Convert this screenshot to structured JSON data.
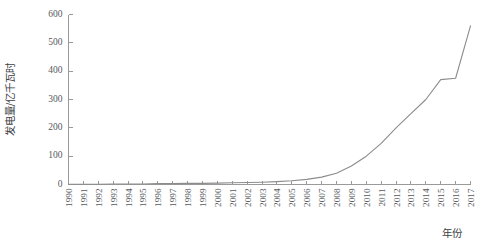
{
  "chart_data": {
    "type": "line",
    "title": "",
    "subtitle": "",
    "xlabel": "年份",
    "ylabel": "发电量/亿千瓦时",
    "xlim": [
      1990,
      2017
    ],
    "ylim": [
      0,
      600
    ],
    "ytick_step": 100,
    "grid": false,
    "legend": false,
    "legend_position": "none",
    "line_color": "#8c8c8c",
    "axis_color": "#9a9a9a",
    "background_color": "#ffffff",
    "categories": [
      "1990",
      "1991",
      "1992",
      "1993",
      "1994",
      "1995",
      "1996",
      "1997",
      "1998",
      "1999",
      "2000",
      "2001",
      "2002",
      "2003",
      "2004",
      "2005",
      "2006",
      "2007",
      "2008",
      "2009",
      "2010",
      "2011",
      "2012",
      "2013",
      "2014",
      "2015",
      "2016",
      "2017"
    ],
    "x": [
      1990,
      1991,
      1992,
      1993,
      1994,
      1995,
      1996,
      1997,
      1998,
      1999,
      2000,
      2001,
      2002,
      2003,
      2004,
      2005,
      2006,
      2007,
      2008,
      2009,
      2010,
      2011,
      2012,
      2013,
      2014,
      2015,
      2016,
      2017
    ],
    "values": [
      1,
      1,
      1,
      2,
      2,
      2,
      3,
      3,
      4,
      4,
      5,
      6,
      7,
      8,
      10,
      13,
      18,
      26,
      40,
      65,
      100,
      145,
      200,
      250,
      300,
      370,
      375,
      560
    ],
    "yticks": [
      0,
      100,
      200,
      300,
      400,
      500,
      600
    ],
    "ytick_labels": [
      "0",
      "100",
      "200",
      "300",
      "400",
      "500",
      "600"
    ],
    "xticks": [
      1990,
      1991,
      1992,
      1993,
      1994,
      1995,
      1996,
      1997,
      1998,
      1999,
      2000,
      2001,
      2002,
      2003,
      2004,
      2005,
      2006,
      2007,
      2008,
      2009,
      2010,
      2011,
      2012,
      2013,
      2014,
      2015,
      2016,
      2017
    ],
    "annotations": []
  }
}
